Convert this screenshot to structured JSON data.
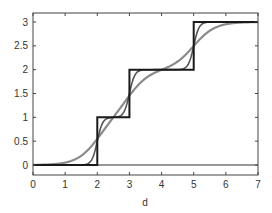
{
  "chart_data": {
    "type": "line",
    "title": "",
    "xlabel": "d",
    "ylabel": "",
    "xlim": [
      0,
      7
    ],
    "ylim": [
      -0.2,
      3.2
    ],
    "grid": false,
    "legend": null,
    "x_ticks": [
      "0",
      "1",
      "2",
      "3",
      "4",
      "5",
      "6",
      "7"
    ],
    "y_ticks": [
      "0",
      "0.5",
      "1",
      "1.5",
      "2",
      "2.5",
      "3"
    ],
    "series": [
      {
        "name": "step",
        "color": "#1a1a1a",
        "description": "Staircase step function with jumps at d=2, 3, 5",
        "x": [
          0,
          2,
          2,
          3,
          3,
          5,
          5,
          7
        ],
        "y": [
          0,
          0,
          1,
          1,
          2,
          2,
          3,
          3
        ]
      },
      {
        "name": "steep sigmoid",
        "color": "#555555",
        "description": "Sum of steep sigmoids centered at 2, 3, 5",
        "centers": [
          2,
          3,
          5
        ],
        "steepness": 12
      },
      {
        "name": "smooth sigmoid",
        "color": "#8a8a8a",
        "description": "Sum of smooth sigmoids centered at 2, 3, 5",
        "centers": [
          2,
          3,
          5
        ],
        "steepness": 3
      },
      {
        "name": "baseline",
        "color": "#333333",
        "x": [
          0,
          7
        ],
        "y": [
          0,
          0
        ]
      }
    ]
  }
}
